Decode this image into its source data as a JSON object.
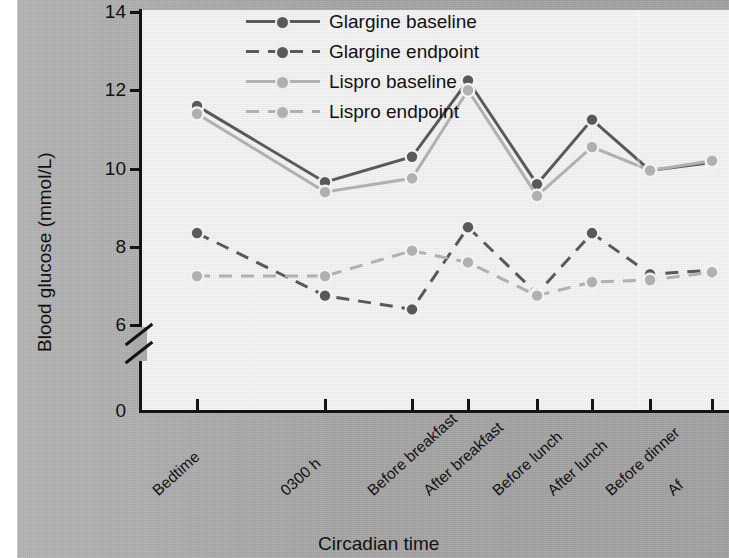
{
  "chart_data": {
    "type": "line",
    "title": "",
    "xlabel": "Circadian time",
    "ylabel": "Blood glucose (mmol/L)",
    "categories": [
      "Bedtime",
      "0300 h",
      "Before breakfast",
      "After breakfast",
      "Before lunch",
      "After lunch",
      "Before dinner",
      "After dinner"
    ],
    "category_labels_visible": [
      "Bedtime",
      "0300 h",
      "Before breakfast",
      "After breakfast",
      "Before lunch",
      "After lunch",
      "Before dinner",
      "Af"
    ],
    "yticks": [
      0,
      6,
      8,
      10,
      12,
      14
    ],
    "ytick_labels": [
      "0",
      "6",
      "8",
      "10",
      "12",
      "14"
    ],
    "ylim": [
      6,
      14
    ],
    "axis_break": true,
    "axis_break_between": [
      0,
      6
    ],
    "grid": false,
    "legend_position": "top-center",
    "note": "right edge of figure is cropped; last category label truncated",
    "series": [
      {
        "name": "Glargine baseline",
        "color": "#595959",
        "dash": "solid",
        "values": [
          11.6,
          9.65,
          10.3,
          12.25,
          9.6,
          11.25,
          9.95,
          10.15
        ]
      },
      {
        "name": "Glargine endpoint",
        "color": "#595959",
        "dash": "dashed",
        "values": [
          8.35,
          6.75,
          6.4,
          8.5,
          6.8,
          8.35,
          7.3,
          7.4
        ]
      },
      {
        "name": "Lispro baseline",
        "color": "#b0b0b0",
        "dash": "solid",
        "values": [
          11.4,
          9.4,
          9.75,
          12.0,
          9.3,
          10.55,
          9.95,
          10.2
        ]
      },
      {
        "name": "Lispro endpoint",
        "color": "#b0b0b0",
        "dash": "dashed",
        "values": [
          7.25,
          7.25,
          7.9,
          7.6,
          6.75,
          7.1,
          7.15,
          7.35
        ]
      }
    ]
  },
  "legend": {
    "items": [
      {
        "label": "Glargine baseline"
      },
      {
        "label": "Glargine endpoint"
      },
      {
        "label": "Lispro baseline"
      },
      {
        "label": "Lispro endpoint"
      }
    ]
  },
  "colors": {
    "glargine": "#595959",
    "lispro": "#b0b0b0",
    "panel": "#ededed",
    "page": "#a9a9a9",
    "axis": "#131313"
  }
}
